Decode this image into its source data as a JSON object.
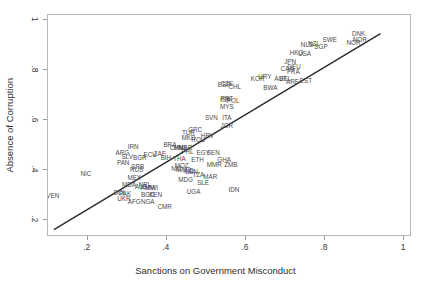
{
  "chart_data": {
    "type": "scatter",
    "title": "",
    "xlabel": "Sanctions on Government Misconduct",
    "ylabel": "Absence of Corruption",
    "xlim": [
      0.1,
      1.02
    ],
    "ylim": [
      0.13,
      1.02
    ],
    "xticks": [
      ".2",
      ".4",
      ".6",
      ".8",
      "1"
    ],
    "xtick_values": [
      0.2,
      0.4,
      0.6,
      0.8,
      1.0
    ],
    "yticks": [
      ".2",
      ".4",
      ".6",
      ".8",
      "1"
    ],
    "ytick_values": [
      0.2,
      0.4,
      0.6,
      0.8,
      1.0
    ],
    "grid": false,
    "legend": "none",
    "marker_style": "text-label",
    "fit_line": {
      "type": "linear",
      "x_start": 0.115,
      "y_start": 0.152,
      "x_end": 0.945,
      "y_end": 0.945
    },
    "points": [
      {
        "label": "VEN",
        "x": 0.112,
        "y": 0.295
      },
      {
        "label": "NIC",
        "x": 0.196,
        "y": 0.383
      },
      {
        "label": "ARG",
        "x": 0.288,
        "y": 0.468
      },
      {
        "label": "IRN",
        "x": 0.315,
        "y": 0.492
      },
      {
        "label": "SLV",
        "x": 0.3,
        "y": 0.452
      },
      {
        "label": "BGR",
        "x": 0.332,
        "y": 0.447
      },
      {
        "label": "PAN",
        "x": 0.29,
        "y": 0.427
      },
      {
        "label": "SRB",
        "x": 0.327,
        "y": 0.412
      },
      {
        "label": "RUS",
        "x": 0.324,
        "y": 0.4
      },
      {
        "label": "MEX",
        "x": 0.318,
        "y": 0.368
      },
      {
        "label": "MDA",
        "x": 0.305,
        "y": 0.337
      },
      {
        "label": "NPL",
        "x": 0.345,
        "y": 0.337
      },
      {
        "label": "ALB",
        "x": 0.335,
        "y": 0.33
      },
      {
        "label": "KHM",
        "x": 0.352,
        "y": 0.328
      },
      {
        "label": "MWI",
        "x": 0.362,
        "y": 0.327
      },
      {
        "label": "BOL",
        "x": 0.282,
        "y": 0.305
      },
      {
        "label": "PAK",
        "x": 0.295,
        "y": 0.302
      },
      {
        "label": "UKR",
        "x": 0.292,
        "y": 0.283
      },
      {
        "label": "BGD",
        "x": 0.352,
        "y": 0.3
      },
      {
        "label": "KEN",
        "x": 0.372,
        "y": 0.297
      },
      {
        "label": "AFG",
        "x": 0.318,
        "y": 0.27
      },
      {
        "label": "NGA",
        "x": 0.352,
        "y": 0.272
      },
      {
        "label": "CMR",
        "x": 0.395,
        "y": 0.252
      },
      {
        "label": "ECU",
        "x": 0.358,
        "y": 0.458
      },
      {
        "label": "ZAF",
        "x": 0.382,
        "y": 0.462
      },
      {
        "label": "BIH",
        "x": 0.398,
        "y": 0.447
      },
      {
        "label": "BRA",
        "x": 0.408,
        "y": 0.5
      },
      {
        "label": "CHN",
        "x": 0.425,
        "y": 0.488
      },
      {
        "label": "THA",
        "x": 0.432,
        "y": 0.442
      },
      {
        "label": "MNE",
        "x": 0.435,
        "y": 0.487
      },
      {
        "label": "MAR",
        "x": 0.447,
        "y": 0.486
      },
      {
        "label": "PHL",
        "x": 0.452,
        "y": 0.47
      },
      {
        "label": "MOZ",
        "x": 0.438,
        "y": 0.415
      },
      {
        "label": "NIC2",
        "x": 0.425,
        "y": 0.402
      },
      {
        "label": "MNG",
        "x": 0.442,
        "y": 0.398
      },
      {
        "label": "IND",
        "x": 0.455,
        "y": 0.393
      },
      {
        "label": "MDG",
        "x": 0.448,
        "y": 0.36
      },
      {
        "label": "LBN",
        "x": 0.463,
        "y": 0.392
      },
      {
        "label": "TZA",
        "x": 0.48,
        "y": 0.378
      },
      {
        "label": "SLE",
        "x": 0.492,
        "y": 0.348
      },
      {
        "label": "UGA",
        "x": 0.468,
        "y": 0.312
      },
      {
        "label": "ETH",
        "x": 0.478,
        "y": 0.44
      },
      {
        "label": "EGY",
        "x": 0.492,
        "y": 0.465
      },
      {
        "label": "SEN",
        "x": 0.518,
        "y": 0.465
      },
      {
        "label": "MMR",
        "x": 0.52,
        "y": 0.42
      },
      {
        "label": "GHA",
        "x": 0.545,
        "y": 0.44
      },
      {
        "label": "ZMB",
        "x": 0.562,
        "y": 0.42
      },
      {
        "label": "MAR2",
        "x": 0.51,
        "y": 0.37
      },
      {
        "label": "IDN",
        "x": 0.57,
        "y": 0.318
      },
      {
        "label": "TUR",
        "x": 0.455,
        "y": 0.545
      },
      {
        "label": "GRC",
        "x": 0.472,
        "y": 0.558
      },
      {
        "label": "MKD",
        "x": 0.455,
        "y": 0.528
      },
      {
        "label": "HRV",
        "x": 0.503,
        "y": 0.535
      },
      {
        "label": "ROU",
        "x": 0.48,
        "y": 0.52
      },
      {
        "label": "SVN",
        "x": 0.513,
        "y": 0.608
      },
      {
        "label": "ITA",
        "x": 0.552,
        "y": 0.607
      },
      {
        "label": "JOR",
        "x": 0.552,
        "y": 0.573
      },
      {
        "label": "MYS",
        "x": 0.552,
        "y": 0.653
      },
      {
        "label": "ISR",
        "x": 0.548,
        "y": 0.678
      },
      {
        "label": "POL",
        "x": 0.568,
        "y": 0.675
      },
      {
        "label": "PRT",
        "x": 0.552,
        "y": 0.682
      },
      {
        "label": "ESP",
        "x": 0.545,
        "y": 0.74
      },
      {
        "label": "CZE",
        "x": 0.552,
        "y": 0.742
      },
      {
        "label": "CHL",
        "x": 0.572,
        "y": 0.733
      },
      {
        "label": "KOR",
        "x": 0.63,
        "y": 0.762
      },
      {
        "label": "URY",
        "x": 0.648,
        "y": 0.772
      },
      {
        "label": "BWA",
        "x": 0.662,
        "y": 0.728
      },
      {
        "label": "AUT",
        "x": 0.688,
        "y": 0.763
      },
      {
        "label": "BEL",
        "x": 0.7,
        "y": 0.765
      },
      {
        "label": "ARE",
        "x": 0.718,
        "y": 0.752
      },
      {
        "label": "EST",
        "x": 0.752,
        "y": 0.755
      },
      {
        "label": "CAN",
        "x": 0.705,
        "y": 0.805
      },
      {
        "label": "DEU",
        "x": 0.722,
        "y": 0.81
      },
      {
        "label": "JPN",
        "x": 0.712,
        "y": 0.83
      },
      {
        "label": "FRA",
        "x": 0.72,
        "y": 0.79
      },
      {
        "label": "HKG",
        "x": 0.728,
        "y": 0.868
      },
      {
        "label": "USA",
        "x": 0.748,
        "y": 0.865
      },
      {
        "label": "NLD",
        "x": 0.755,
        "y": 0.898
      },
      {
        "label": "NZL",
        "x": 0.772,
        "y": 0.905
      },
      {
        "label": "SGP",
        "x": 0.79,
        "y": 0.89
      },
      {
        "label": "SWE",
        "x": 0.812,
        "y": 0.918
      },
      {
        "label": "NOR",
        "x": 0.872,
        "y": 0.908
      },
      {
        "label": "NOR2",
        "x": 0.888,
        "y": 0.92
      },
      {
        "label": "DNK",
        "x": 0.885,
        "y": 0.945
      }
    ]
  }
}
